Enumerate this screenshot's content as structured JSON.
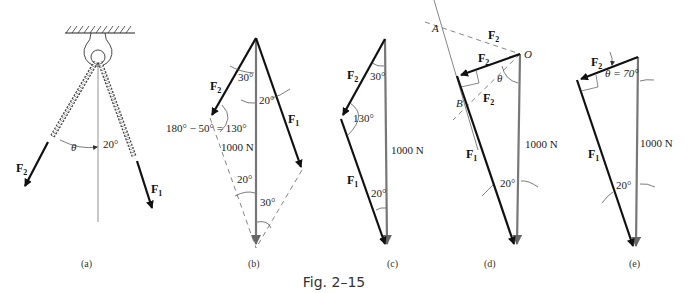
{
  "figure": {
    "caption": "Fig. 2–15",
    "panels": [
      {
        "id": "a",
        "label": "(a)",
        "force_labels": {
          "f2": "F",
          "f2_sub": "2",
          "f1": "F",
          "f1_sub": "1"
        },
        "angles": {
          "theta": "θ",
          "right": "20°"
        }
      },
      {
        "id": "b",
        "label": "(b)",
        "force_labels": {
          "f2": "F",
          "f2_sub": "2",
          "f1": "F",
          "f1_sub": "1"
        },
        "angles": {
          "top_left": "30°",
          "top_right": "20°",
          "left_vertex": "180° − 50° = 130°",
          "bottom_left": "20°",
          "bottom_right": "30°"
        },
        "resultant": "1000 N"
      },
      {
        "id": "c",
        "label": "(c)",
        "force_labels": {
          "f2": "F",
          "f2_sub": "2",
          "f1": "F",
          "f1_sub": "1"
        },
        "angles": {
          "top": "30°",
          "vertex": "130°",
          "bottom": "20°"
        },
        "resultant": "1000 N"
      },
      {
        "id": "d",
        "label": "(d)",
        "points": {
          "a": "A",
          "b": "B",
          "o": "O"
        },
        "force_labels": {
          "f2_dashed_top": "F",
          "f2_solid": "F",
          "f2_dashed_bottom": "F",
          "f2_sub": "2",
          "f1": "F",
          "f1_sub": "1"
        },
        "angles": {
          "theta": "θ",
          "bottom": "20°"
        },
        "resultant": "1000 N"
      },
      {
        "id": "e",
        "label": "(e)",
        "force_labels": {
          "f2": "F",
          "f2_sub": "2",
          "f1": "F",
          "f1_sub": "1"
        },
        "angles": {
          "theta": "θ = 70°",
          "bottom": "20°"
        },
        "resultant": "1000 N"
      }
    ]
  }
}
